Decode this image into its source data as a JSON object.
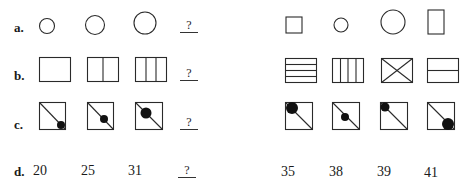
{
  "rows": [
    {
      "label": "a.",
      "left_answer": "?"
    },
    {
      "label": "b.",
      "left_answer": "?"
    },
    {
      "label": "c.",
      "left_answer": "?"
    },
    {
      "label": "d.",
      "left_answer": "?",
      "left_values": [
        "20",
        "25",
        "31"
      ],
      "right_values": [
        "35",
        "38",
        "39",
        "41"
      ]
    }
  ],
  "figures": {
    "a_left": [
      "small-circle",
      "medium-circle",
      "large-circle"
    ],
    "a_right": [
      "small-square",
      "small-circle",
      "large-circle",
      "tall-rectangle"
    ],
    "b_left": [
      "rectangle-1-section",
      "rectangle-2-sections",
      "rectangle-3-sections"
    ],
    "b_right": [
      "rectangle-4-horizontal-strips",
      "rectangle-4-vertical-columns",
      "rectangle-with-x",
      "rectangle-2-horizontal-strips"
    ],
    "c_left": [
      "square-diagonal-small-dot-bottom-right",
      "square-diagonal-medium-dot-center",
      "square-diagonal-large-dot-upper"
    ],
    "c_right": [
      "square-diagonal-large-dot-top-left",
      "square-diagonal-medium-dot-center",
      "square-diagonal-medium-dot-top-left",
      "square-diagonal-large-dot-bottom-right"
    ]
  },
  "colors": {
    "stroke": "#2a2a2a",
    "background": "#ffffff"
  }
}
